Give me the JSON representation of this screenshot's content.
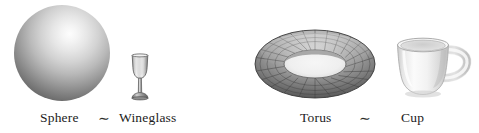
{
  "figure": {
    "background_color": "#ffffff",
    "width": 479,
    "height": 133
  },
  "pairs": [
    {
      "id": "sphere-wineglass",
      "left_object": {
        "name": "sphere",
        "label": "Sphere",
        "render": "shaded-grey-ball",
        "colors": {
          "highlight": "#fdfdfd",
          "midtone": "#9d9d9d",
          "shadow": "#3c3c3c"
        }
      },
      "relation_symbol": "∼",
      "relation_meaning": "is homeomorphic to",
      "right_object": {
        "name": "wineglass",
        "label": "Wineglass",
        "render": "stemmed-glass",
        "colors": {
          "glass_light": "#e9e9e9",
          "glass_mid": "#b6b6b6",
          "glass_dark": "#6f6f6f"
        }
      }
    },
    {
      "id": "torus-cup",
      "left_object": {
        "name": "torus",
        "label": "Torus",
        "render": "wireframe-donut",
        "colors": {
          "surface_light": "#cfcfcf",
          "surface_mid": "#8d8d8d",
          "surface_dark": "#4a4a4a",
          "mesh_line": "#3a3a3a"
        }
      },
      "relation_symbol": "∼",
      "relation_meaning": "is homeomorphic to",
      "right_object": {
        "name": "cup",
        "label": "Cup",
        "render": "ceramic-mug-with-handle",
        "colors": {
          "ceramic_light": "#fbfbfb",
          "ceramic_mid": "#e3e3e3",
          "ceramic_shadow": "#bfbfbf"
        }
      }
    }
  ]
}
